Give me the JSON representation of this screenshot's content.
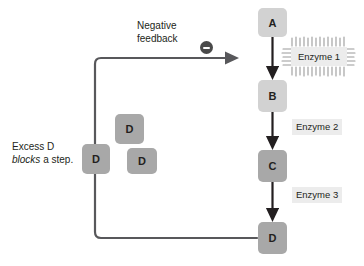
{
  "diagram": {
    "colors": {
      "node_light": "#d2d2d2",
      "node_dark": "#a8a8a8",
      "arrow": "#231f20",
      "feedback_line": "#58585b",
      "enzyme_label_bg": "#ececec",
      "background": "#ffffff"
    },
    "pathway": {
      "nodes": [
        {
          "id": "a",
          "label": "A",
          "shade": "light"
        },
        {
          "id": "b",
          "label": "B",
          "shade": "light"
        },
        {
          "id": "c",
          "label": "C",
          "shade": "dark"
        },
        {
          "id": "d",
          "label": "D",
          "shade": "dark"
        }
      ],
      "steps": [
        {
          "from": "A",
          "to": "B",
          "enzyme": "Enzyme 1"
        },
        {
          "from": "B",
          "to": "C",
          "enzyme": "Enzyme 2"
        },
        {
          "from": "C",
          "to": "D",
          "enzyme": "Enzyme 3"
        }
      ]
    },
    "enzymes": {
      "enzyme_1": "Enzyme 1",
      "enzyme_2": "Enzyme 2",
      "enzyme_3": "Enzyme 3"
    },
    "feedback": {
      "label_line_1": "Negative",
      "label_line_2": "feedback",
      "sign": "minus",
      "target_step": "A to B",
      "source_node": "D"
    },
    "excess": {
      "label_line_1": "Excess D",
      "label_line_2_emphasis": "blocks",
      "label_line_2_rest": " a step.",
      "molecules": [
        {
          "label": "D",
          "position": "on-pathway-block"
        },
        {
          "label": "D",
          "position": "free-upper"
        },
        {
          "label": "D",
          "position": "free-lower"
        }
      ]
    }
  }
}
